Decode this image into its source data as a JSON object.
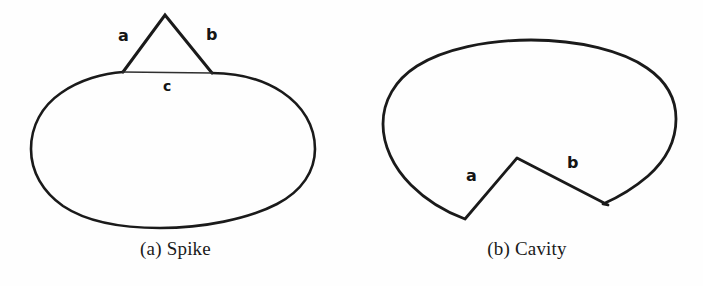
{
  "figure": {
    "background_color": "#fefefe",
    "stroke_color": "#1a1a1a",
    "label_color": "#151515",
    "panels": [
      {
        "id": "spike",
        "caption": "(a) Spike",
        "shape": "ellipse-with-triangular-spike",
        "labels": [
          {
            "text": "a",
            "x": 118,
            "y": 30,
            "edge": "left-spike-edge"
          },
          {
            "text": "b",
            "x": 206,
            "y": 29,
            "edge": "right-spike-edge"
          },
          {
            "text": "c",
            "x": 163,
            "y": 80,
            "edge": "spike-base-chord"
          }
        ],
        "geometry": {
          "ellipse_center_x": 173,
          "ellipse_center_y": 149,
          "ellipse_rx": 142,
          "ellipse_ry": 79,
          "spike_apex": [
            165,
            15
          ],
          "spike_base_left": [
            123,
            72
          ],
          "spike_base_right": [
            212,
            73
          ]
        }
      },
      {
        "id": "cavity",
        "caption": "(b) Cavity",
        "shape": "blob-with-v-notch",
        "labels": [
          {
            "text": "a",
            "x": 118,
            "y": 170,
            "edge": "left-cavity-edge"
          },
          {
            "text": "b",
            "x": 218,
            "y": 158,
            "edge": "right-cavity-edge"
          }
        ],
        "geometry": {
          "blob_bounds": [
            383,
            63,
            668,
            220
          ],
          "notch_apex": [
            517,
            158
          ],
          "notch_left_vertex": [
            465,
            219
          ],
          "notch_right_vertex": [
            608,
            205
          ]
        }
      }
    ]
  }
}
